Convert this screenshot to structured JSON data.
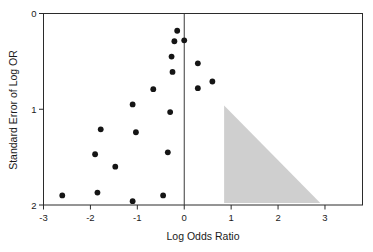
{
  "chart_data": {
    "type": "scatter",
    "title": "",
    "subtitle": "",
    "xlabel": "Log Odds Ratio",
    "ylabel": "Standard Error of Log OR",
    "xlim": [
      -3,
      3.8
    ],
    "ylim": [
      0,
      2
    ],
    "y_inverted": true,
    "grid": false,
    "legend": null,
    "xticks": [
      -3,
      -2,
      -1,
      0,
      1,
      2,
      3
    ],
    "xtick_labels": [
      "-3",
      "-2",
      "-1",
      "0",
      "1",
      "2",
      "3"
    ],
    "yticks": [
      0,
      1,
      2
    ],
    "ytick_labels": [
      "0",
      "1",
      "2"
    ],
    "series": [
      {
        "name": "studies",
        "marker": "filled-circle",
        "color": "#151515",
        "points": [
          {
            "x": -0.15,
            "y": 0.18
          },
          {
            "x": -0.21,
            "y": 0.29
          },
          {
            "x": 0.0,
            "y": 0.28
          },
          {
            "x": -0.27,
            "y": 0.45
          },
          {
            "x": 0.29,
            "y": 0.52
          },
          {
            "x": -0.25,
            "y": 0.61
          },
          {
            "x": 0.6,
            "y": 0.71
          },
          {
            "x": 0.29,
            "y": 0.78
          },
          {
            "x": -0.66,
            "y": 0.79
          },
          {
            "x": -1.1,
            "y": 0.95
          },
          {
            "x": -0.3,
            "y": 1.03
          },
          {
            "x": -1.78,
            "y": 1.21
          },
          {
            "x": -1.03,
            "y": 1.24
          },
          {
            "x": -1.9,
            "y": 1.47
          },
          {
            "x": -0.35,
            "y": 1.45
          },
          {
            "x": -1.47,
            "y": 1.6
          },
          {
            "x": -2.6,
            "y": 1.9
          },
          {
            "x": -1.85,
            "y": 1.87
          },
          {
            "x": -1.1,
            "y": 1.96
          },
          {
            "x": -0.45,
            "y": 1.9
          }
        ]
      }
    ],
    "annotations": [
      {
        "type": "triangle",
        "name": "shaded-funnel-region",
        "color": "#cfcfcf",
        "vertices": [
          {
            "x": 0.85,
            "y": 0.96
          },
          {
            "x": 0.85,
            "y": 1.98
          },
          {
            "x": 2.9,
            "y": 1.98
          }
        ]
      },
      {
        "type": "vline",
        "name": "null-effect-line",
        "x": 0,
        "color": "#3a3a3a"
      }
    ]
  },
  "axes": {
    "x_title": "Log Odds Ratio",
    "y_title": "Standard Error of Log OR"
  }
}
